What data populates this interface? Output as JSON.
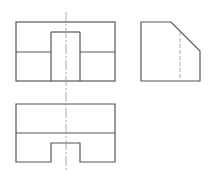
{
  "diagram": {
    "type": "orthographic-three-view",
    "background": "#ffffff",
    "colors": {
      "outline": "#555555",
      "hidden": "#aaaaaa",
      "center": "#999999"
    },
    "views": {
      "front": {
        "label": "front-view",
        "outer": [
          16,
          22,
          115,
          81
        ],
        "lines": [
          [
            16,
            52,
            51,
            52
          ],
          [
            80,
            52,
            115,
            52
          ],
          [
            51,
            32,
            80,
            32
          ],
          [
            51,
            32,
            51,
            81
          ],
          [
            80,
            32,
            80,
            81
          ]
        ]
      },
      "side": {
        "label": "side-view",
        "polygon": [
          [
            141,
            22
          ],
          [
            171,
            22
          ],
          [
            200,
            51
          ],
          [
            200,
            81
          ],
          [
            141,
            81
          ]
        ],
        "hidden": [
          [
            180,
            32,
            180,
            81
          ]
        ]
      },
      "top": {
        "label": "top-view",
        "polygon": [
          [
            16,
            104
          ],
          [
            115,
            104
          ],
          [
            115,
            162
          ],
          [
            80,
            162
          ],
          [
            80,
            143
          ],
          [
            51,
            143
          ],
          [
            51,
            162
          ],
          [
            16,
            162
          ]
        ],
        "lines": [
          [
            16,
            133,
            115,
            133
          ]
        ]
      },
      "center_line": [
        66,
        12,
        66,
        170
      ]
    }
  }
}
